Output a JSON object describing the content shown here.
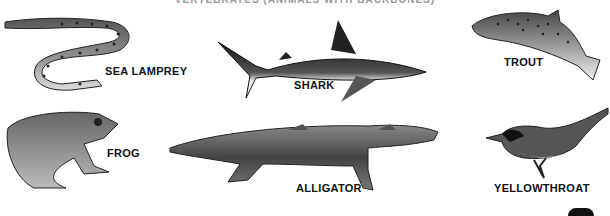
{
  "caption": "VERTEBRATES (ANIMALS WITH BACKBONES)",
  "animals": [
    {
      "name": "sea-lamprey",
      "label": "SEA LAMPREY"
    },
    {
      "name": "shark",
      "label": "SHARK"
    },
    {
      "name": "trout",
      "label": "TROUT"
    },
    {
      "name": "frog",
      "label": "FROG"
    },
    {
      "name": "alligator",
      "label": "ALLIGATOR"
    },
    {
      "name": "yellowthroat",
      "label": "YELLOWTHROAT"
    }
  ]
}
